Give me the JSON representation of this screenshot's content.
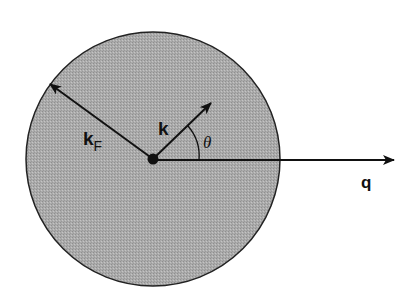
{
  "diagram": {
    "colors": {
      "background": "#ffffff",
      "sphere_fill": "#a8a8a8",
      "stroke": "#111111"
    },
    "sphere": {
      "cx": 153,
      "cy": 159,
      "r": 127
    },
    "origin_dot": {
      "cx": 153,
      "cy": 159,
      "r": 5
    },
    "vectors": [
      {
        "id": "kF",
        "label": "k",
        "subscript": "F",
        "x1": 153,
        "y1": 159,
        "x2": 49,
        "y2": 83
      },
      {
        "id": "k",
        "label": "k",
        "x1": 153,
        "y1": 159,
        "x2": 211,
        "y2": 103
      },
      {
        "id": "q",
        "label": "q",
        "x1": 153,
        "y1": 160,
        "x2": 394,
        "y2": 160
      }
    ],
    "angle": {
      "label": "θ",
      "between": [
        "k",
        "q"
      ]
    },
    "labels": {
      "kF_main": "k",
      "kF_sub": "F",
      "k": "k",
      "q": "q",
      "theta": "θ"
    }
  }
}
